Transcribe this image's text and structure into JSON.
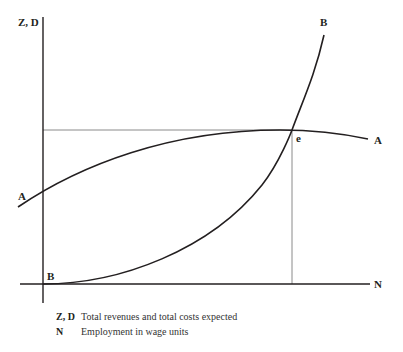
{
  "diagram": {
    "colors": {
      "ink": "#231f20",
      "guide": "#8a8a8a"
    },
    "axes": {
      "y_label": "Z, D",
      "x_label": "N"
    },
    "curves": [
      {
        "id": "A",
        "label_left": "A",
        "label_right": "A",
        "description": "Aggregate demand function D (concave, rising then flattening)"
      },
      {
        "id": "B",
        "label_bottom": "B",
        "label_top": "B",
        "description": "Aggregate supply function Z (convex, rising steeply)"
      }
    ],
    "intersection": {
      "label": "e"
    },
    "legend": [
      {
        "key": "Z, D",
        "text": "Total revenues and total costs expected"
      },
      {
        "key": "N",
        "text": "Employment in wage units"
      }
    ]
  }
}
